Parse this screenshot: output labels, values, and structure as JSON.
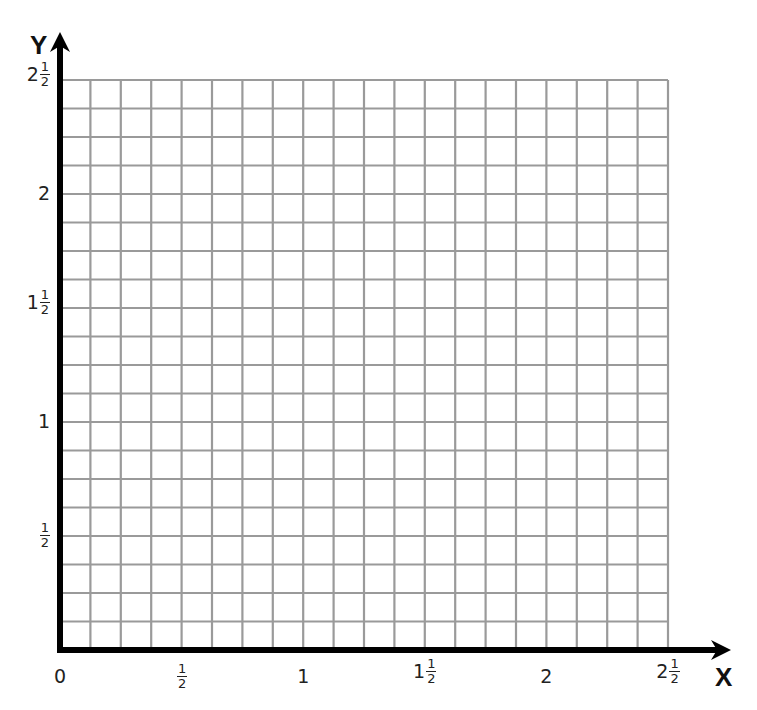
{
  "chart_data": {
    "type": "grid",
    "title": "",
    "xlabel": "X",
    "ylabel": "Y",
    "xlim": [
      0,
      2.5
    ],
    "ylim": [
      0,
      2.5
    ],
    "grid": true,
    "grid_divisions_per_unit": 8,
    "grid_cells_x": 20,
    "grid_cells_y": 20,
    "x_ticks": [
      {
        "value": 0,
        "whole": "0",
        "num": "",
        "den": ""
      },
      {
        "value": 0.5,
        "whole": "",
        "num": "1",
        "den": "2"
      },
      {
        "value": 1,
        "whole": "1",
        "num": "",
        "den": ""
      },
      {
        "value": 1.5,
        "whole": "1",
        "num": "1",
        "den": "2"
      },
      {
        "value": 2,
        "whole": "2",
        "num": "",
        "den": ""
      },
      {
        "value": 2.5,
        "whole": "2",
        "num": "1",
        "den": "2"
      }
    ],
    "y_ticks": [
      {
        "value": 0.5,
        "whole": "",
        "num": "1",
        "den": "2"
      },
      {
        "value": 1,
        "whole": "1",
        "num": "",
        "den": ""
      },
      {
        "value": 1.5,
        "whole": "1",
        "num": "1",
        "den": "2"
      },
      {
        "value": 2,
        "whole": "2",
        "num": "",
        "den": ""
      },
      {
        "value": 2.5,
        "whole": "2",
        "num": "1",
        "den": "2"
      }
    ],
    "series": []
  },
  "colors": {
    "axis": "#000000",
    "grid": "#9a9a9a",
    "background": "#ffffff"
  },
  "axes": {
    "x_label": "X",
    "y_label": "Y"
  }
}
